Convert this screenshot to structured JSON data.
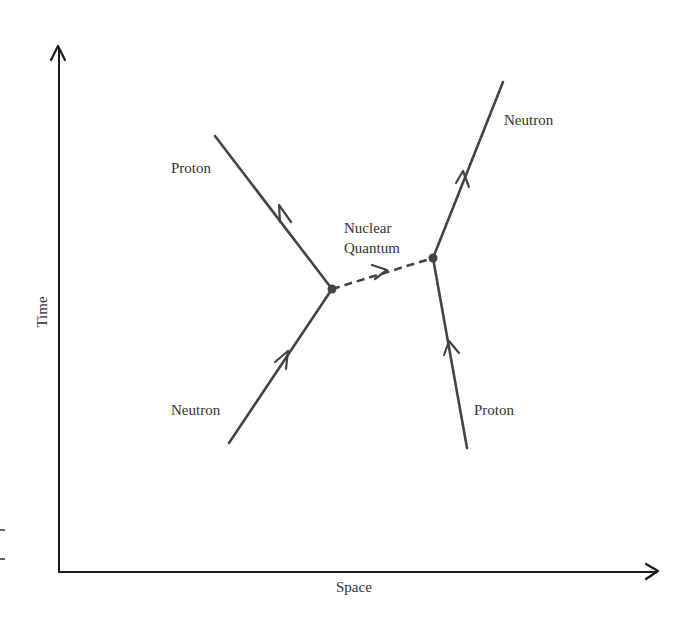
{
  "diagram": {
    "type": "spacetime-feynman-diagram",
    "axes": {
      "x_label": "Space",
      "y_label": "Time"
    },
    "particles": [
      {
        "label": "Neutron",
        "role": "incoming-left"
      },
      {
        "label": "Proton",
        "role": "outgoing-left"
      },
      {
        "label": "Proton",
        "role": "incoming-right"
      },
      {
        "label": "Neutron",
        "role": "outgoing-right"
      }
    ],
    "exchange": {
      "label_line1": "Nuclear",
      "label_line2": "Quantum"
    },
    "colors": {
      "axis": "#1a1a1a",
      "lines": "#444444",
      "text": "#333333",
      "background": "#ffffff"
    }
  }
}
